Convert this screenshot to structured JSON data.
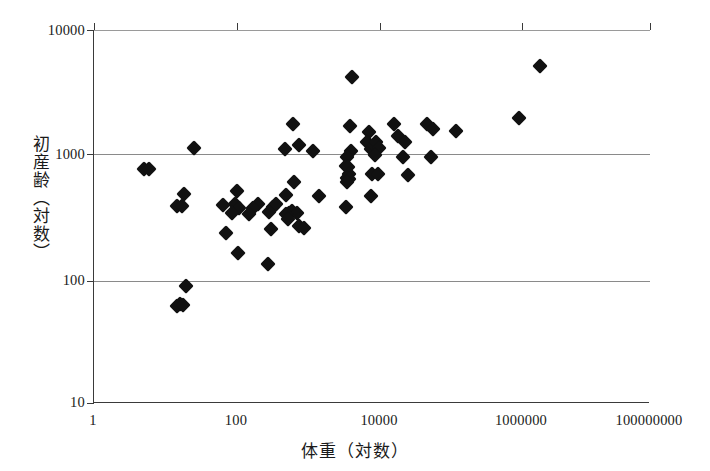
{
  "chart_data": {
    "type": "scatter",
    "title": "",
    "xlabel": "体重（対数）",
    "ylabel": "初産齢（対数）",
    "xscale": "log",
    "yscale": "log",
    "xlim": [
      1,
      100000000
    ],
    "ylim": [
      10,
      10000
    ],
    "grid": true,
    "gridlines_y": [
      1000,
      100
    ],
    "legend": "none",
    "xticklabels": [
      "1",
      "100",
      "10000",
      "1000000",
      "100000000"
    ],
    "xtickvalues": [
      1,
      100,
      10000,
      1000000,
      100000000
    ],
    "yticklabels": [
      "10000",
      "1000",
      "100",
      "10"
    ],
    "ytickvalues": [
      10000,
      1000,
      100,
      10
    ],
    "marker": "diamond",
    "marker_color": "#111111",
    "points": [
      {
        "x": 5.2,
        "y": 760
      },
      {
        "x": 6.1,
        "y": 760
      },
      {
        "x": 27,
        "y": 1130
      },
      {
        "x": 20,
        "y": 480
      },
      {
        "x": 15.5,
        "y": 385
      },
      {
        "x": 18.5,
        "y": 385
      },
      {
        "x": 21,
        "y": 88
      },
      {
        "x": 17.5,
        "y": 63
      },
      {
        "x": 15.5,
        "y": 60
      },
      {
        "x": 19,
        "y": 62
      },
      {
        "x": 113,
        "y": 510
      },
      {
        "x": 72,
        "y": 390
      },
      {
        "x": 105,
        "y": 400
      },
      {
        "x": 122,
        "y": 370
      },
      {
        "x": 95,
        "y": 340
      },
      {
        "x": 80,
        "y": 235
      },
      {
        "x": 118,
        "y": 160
      },
      {
        "x": 225,
        "y": 400
      },
      {
        "x": 195,
        "y": 370
      },
      {
        "x": 168,
        "y": 330
      },
      {
        "x": 370,
        "y": 380
      },
      {
        "x": 420,
        "y": 400
      },
      {
        "x": 580,
        "y": 470
      },
      {
        "x": 330,
        "y": 345
      },
      {
        "x": 350,
        "y": 250
      },
      {
        "x": 320,
        "y": 132
      },
      {
        "x": 730,
        "y": 1750
      },
      {
        "x": 560,
        "y": 1100
      },
      {
        "x": 900,
        "y": 1180
      },
      {
        "x": 760,
        "y": 600
      },
      {
        "x": 640,
        "y": 340
      },
      {
        "x": 700,
        "y": 350
      },
      {
        "x": 820,
        "y": 340
      },
      {
        "x": 580,
        "y": 330
      },
      {
        "x": 620,
        "y": 300
      },
      {
        "x": 900,
        "y": 265
      },
      {
        "x": 1050,
        "y": 255
      },
      {
        "x": 1400,
        "y": 1060
      },
      {
        "x": 1700,
        "y": 460
      },
      {
        "x": 4200,
        "y": 375
      },
      {
        "x": 5200,
        "y": 4200
      },
      {
        "x": 4800,
        "y": 1700
      },
      {
        "x": 5000,
        "y": 1070
      },
      {
        "x": 4300,
        "y": 950
      },
      {
        "x": 4200,
        "y": 800
      },
      {
        "x": 4500,
        "y": 790
      },
      {
        "x": 4600,
        "y": 700
      },
      {
        "x": 4300,
        "y": 640
      },
      {
        "x": 4700,
        "y": 630
      },
      {
        "x": 4400,
        "y": 600
      },
      {
        "x": 9000,
        "y": 1500
      },
      {
        "x": 8500,
        "y": 1250
      },
      {
        "x": 9500,
        "y": 1100
      },
      {
        "x": 10500,
        "y": 1180
      },
      {
        "x": 11500,
        "y": 1250
      },
      {
        "x": 12500,
        "y": 1120
      },
      {
        "x": 11000,
        "y": 980
      },
      {
        "x": 10000,
        "y": 700
      },
      {
        "x": 12000,
        "y": 700
      },
      {
        "x": 9500,
        "y": 460
      },
      {
        "x": 21000,
        "y": 1750
      },
      {
        "x": 24000,
        "y": 1400
      },
      {
        "x": 30000,
        "y": 1250
      },
      {
        "x": 28000,
        "y": 950
      },
      {
        "x": 33000,
        "y": 680
      },
      {
        "x": 62000,
        "y": 1750
      },
      {
        "x": 75000,
        "y": 1600
      },
      {
        "x": 70000,
        "y": 950
      },
      {
        "x": 160000,
        "y": 1550
      },
      {
        "x": 1300000,
        "y": 1950
      },
      {
        "x": 2600000,
        "y": 5100
      }
    ]
  },
  "axes": {
    "y_title": "初産齢（対数）",
    "x_title": "体重（対数）"
  }
}
